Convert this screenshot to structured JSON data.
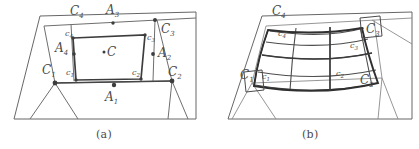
{
  "figure": {
    "kind": "two-panel-geometry-diagram",
    "caption_a": "(a)",
    "caption_b": "(b)",
    "panel_a": {
      "name": "cell-decomposition",
      "description": "Parallelogram domain partitioned into polygonal cells with an inner quadrilateral.",
      "outer_labels": [
        {
          "id": "C1",
          "base": "C",
          "sub": "1"
        },
        {
          "id": "C2",
          "base": "C",
          "sub": "2"
        },
        {
          "id": "C3",
          "base": "C",
          "sub": "3"
        },
        {
          "id": "C4",
          "base": "C",
          "sub": "4"
        }
      ],
      "edge_labels": [
        {
          "id": "A1",
          "base": "A",
          "sub": "1"
        },
        {
          "id": "A2",
          "base": "A",
          "sub": "2"
        },
        {
          "id": "A3",
          "base": "A",
          "sub": "3"
        },
        {
          "id": "A4",
          "base": "A",
          "sub": "4"
        }
      ],
      "inner_labels": [
        {
          "id": "c1",
          "base": "c",
          "sub": "1"
        },
        {
          "id": "c2",
          "base": "c",
          "sub": "2"
        },
        {
          "id": "c3",
          "base": "c",
          "sub": "3"
        },
        {
          "id": "c4",
          "base": "c",
          "sub": "4"
        }
      ],
      "center_label": {
        "id": "C",
        "base": "C",
        "sub": ""
      }
    },
    "panel_b": {
      "name": "curved-mesh-overlay",
      "description": "Same parallelogram domain with a curvilinear quadrilateral mesh drawn over the inner region.",
      "outer_labels": [
        {
          "id": "C1",
          "base": "C",
          "sub": "1"
        },
        {
          "id": "C2",
          "base": "C",
          "sub": "2"
        },
        {
          "id": "C3",
          "base": "C",
          "sub": "3"
        },
        {
          "id": "C4",
          "base": "C",
          "sub": "4"
        }
      ],
      "inner_labels": [
        {
          "id": "c1",
          "base": "c",
          "sub": "1"
        },
        {
          "id": "c2",
          "base": "c",
          "sub": "2"
        },
        {
          "id": "c3",
          "base": "c",
          "sub": "3"
        },
        {
          "id": "c4",
          "base": "c",
          "sub": "4"
        }
      ]
    },
    "colors": {
      "background": "#ffffff",
      "ink": "#5b5b5b",
      "ink_bold": "#3a3a3a",
      "label": "#4a4a4a",
      "node": "#3d3d3d"
    }
  }
}
